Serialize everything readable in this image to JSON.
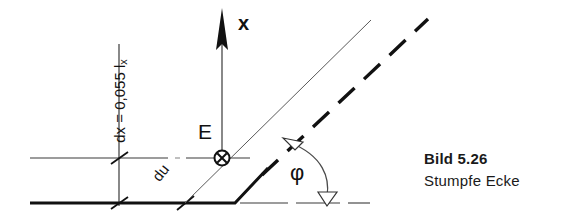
{
  "figure": {
    "caption_title": "Bild 5.26",
    "caption_subtitle": "Stumpfe Ecke",
    "labels": {
      "axis_x": "x",
      "point_E": "E",
      "angle_phi": "φ",
      "dx_prefix": "dx = 0,055 l",
      "dx_subscript": "x",
      "du": "du"
    },
    "colors": {
      "ink": "#111111",
      "thin_line": "#3a3a3a",
      "caption": "#1a1a1a",
      "background": "#ffffff"
    }
  }
}
